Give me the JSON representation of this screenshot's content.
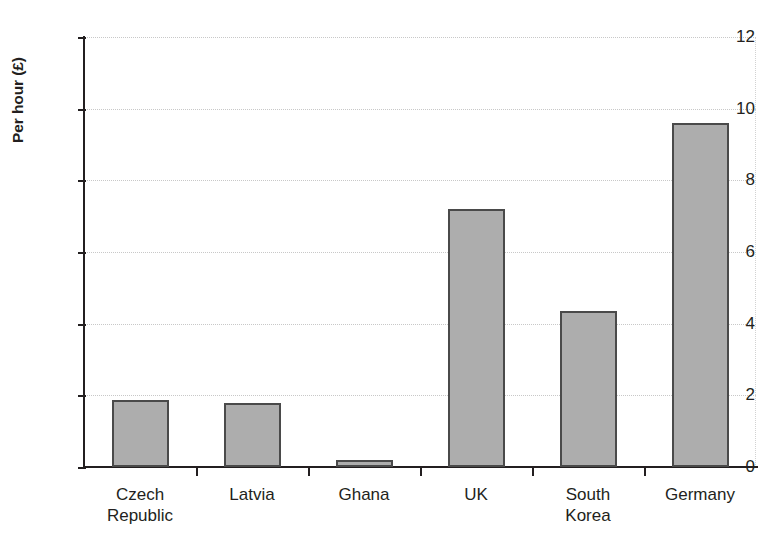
{
  "chart_data": {
    "type": "bar",
    "title": "",
    "xlabel": "",
    "ylabel": "Per hour (£)",
    "categories": [
      "Czech Republic",
      "Latvia",
      "Ghana",
      "UK",
      "South Korea",
      "Germany"
    ],
    "values": [
      1.87,
      1.8,
      0.2,
      7.2,
      4.35,
      9.6
    ],
    "ylim": [
      0,
      12
    ],
    "yticks": [
      0,
      2,
      4,
      6,
      8,
      10,
      12
    ],
    "ytick_labels": [
      "0",
      "2",
      "4",
      "6",
      "8",
      "10",
      "12"
    ],
    "grid": true,
    "legend": false,
    "bar_fill_color": "#adadad",
    "bar_border_color": "#4a4a4a",
    "axis_color": "#231f20",
    "gridline_color": "#c8c8c8",
    "background_color": "#ffffff"
  },
  "axis": {
    "y_title": "Per hour (£)"
  }
}
